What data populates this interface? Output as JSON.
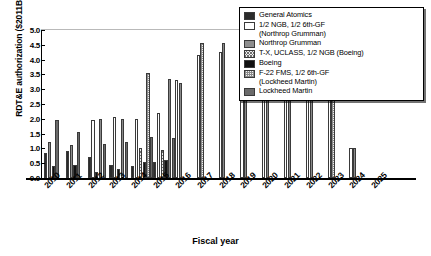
{
  "chart_data": {
    "type": "bar",
    "title": "",
    "xlabel": "Fiscal year",
    "ylabel": "RDT&E authorization ($2011B)",
    "ylim": [
      0.0,
      5.0
    ],
    "ytick_labels": [
      "0.0",
      "0.5",
      "1.0",
      "1.5",
      "2.0",
      "2.5",
      "3.0",
      "3.5",
      "4.0",
      "4.5",
      "5.0"
    ],
    "ytick_values": [
      0.0,
      0.5,
      1.0,
      1.5,
      2.0,
      2.5,
      3.0,
      3.5,
      4.0,
      4.5,
      5.0
    ],
    "grid": false,
    "legend_position": "top-right",
    "categories": [
      "2010",
      "2011",
      "2012",
      "2013",
      "2014",
      "2015",
      "2016",
      "2017",
      "2018",
      "2019",
      "2020",
      "2021",
      "2022",
      "2023",
      "2024",
      "2025"
    ],
    "series": [
      {
        "name": "General Atomics",
        "values": [
          0.85,
          0.9,
          0.7,
          0.45,
          0.4,
          0.55,
          0.0,
          0.0,
          0.0,
          0.0,
          0.0,
          0.0,
          0.0,
          0.0,
          0.0,
          0.0
        ]
      },
      {
        "name": "1/2 NGB, 1/2 6th-GF (Northrop Grumman)",
        "values": [
          0.0,
          0.0,
          1.95,
          2.05,
          2.0,
          2.2,
          3.3,
          4.15,
          4.25,
          3.7,
          3.7,
          3.7,
          2.7,
          2.7,
          1.0,
          0.0
        ]
      },
      {
        "name": "Northrop Grumman",
        "values": [
          1.2,
          1.1,
          0.0,
          0.0,
          0.0,
          0.0,
          0.0,
          0.0,
          0.0,
          0.0,
          0.0,
          0.0,
          0.0,
          0.0,
          0.0,
          0.0
        ]
      },
      {
        "name": "T-X, UCLASS, 1/2 NGB (Boeing)",
        "values": [
          0.0,
          0.0,
          0.0,
          0.0,
          1.0,
          0.95,
          0.0,
          0.0,
          0.0,
          0.0,
          0.0,
          0.0,
          0.0,
          0.0,
          0.0,
          0.0
        ]
      },
      {
        "name": "Boeing",
        "values": [
          0.4,
          0.45,
          0.2,
          0.3,
          0.55,
          0.6,
          0.0,
          0.0,
          0.0,
          0.0,
          0.0,
          0.0,
          0.0,
          0.0,
          0.0,
          0.0
        ]
      },
      {
        "name": "F-22 FMS, 1/2 6th-GF (Lockheed Martin)",
        "values": [
          0.0,
          0.0,
          2.0,
          2.0,
          3.55,
          3.35,
          3.2,
          4.55,
          4.55,
          4.55,
          4.55,
          2.7,
          2.7,
          2.7,
          1.0,
          0.0
        ]
      },
      {
        "name": "Lockheed Martin",
        "values": [
          1.95,
          1.55,
          1.15,
          1.2,
          1.4,
          1.35,
          0.0,
          0.0,
          0.0,
          0.0,
          0.0,
          0.0,
          0.0,
          0.0,
          0.0,
          0.0
        ]
      }
    ],
    "series_colors": [
      "#2b2b2b",
      "#ffffff",
      "#8e8e8e",
      "#ededed",
      "#111111",
      "#f2f2f2",
      "#6a6a6a"
    ]
  },
  "legend": {
    "entries": [
      {
        "label": "General Atomics",
        "label2": ""
      },
      {
        "label": "1/2 NGB, 1/2 6th-GF",
        "label2": "(Northrop Grumman)"
      },
      {
        "label": "Northrop Grumman",
        "label2": ""
      },
      {
        "label": "T-X, UCLASS, 1/2 NGB (Boeing)",
        "label2": ""
      },
      {
        "label": "Boeing",
        "label2": ""
      },
      {
        "label": "F-22 FMS, 1/2 6th-GF",
        "label2": "(Lockheed Martin)"
      },
      {
        "label": "Lockheed Martin",
        "label2": ""
      }
    ]
  }
}
